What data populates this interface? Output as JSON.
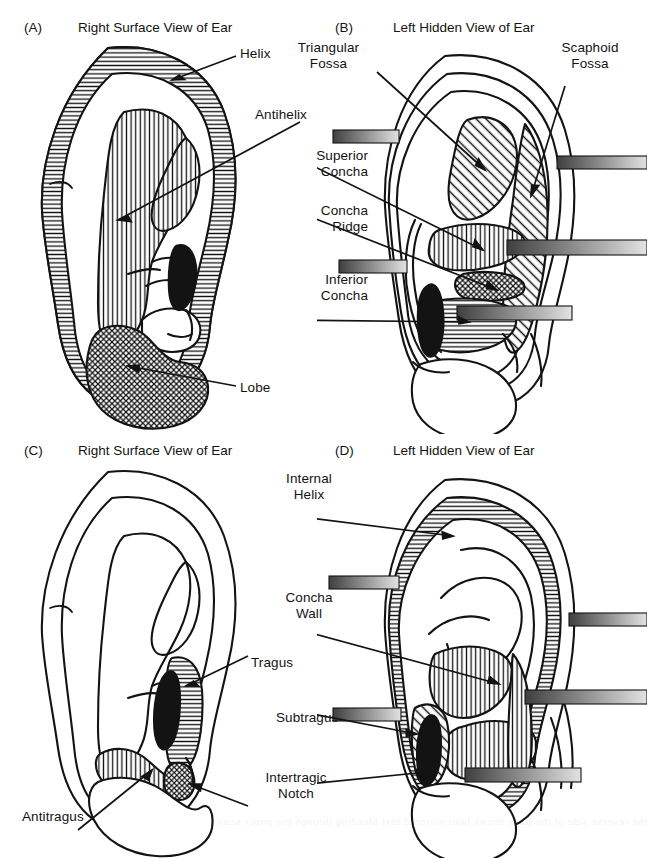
{
  "figure": {
    "background_color": "#ffffff",
    "ink_color": "#131313",
    "panel_count": 4
  },
  "panels": [
    {
      "tag": "(A)",
      "title": "Right Surface View of Ear",
      "view": "right-surface",
      "labels": [
        {
          "id": "helix",
          "text": "Helix",
          "align": "left"
        },
        {
          "id": "antihelix",
          "text": "Antihelix",
          "align": "left"
        },
        {
          "id": "lobe",
          "text": "Lobe",
          "align": "left"
        }
      ],
      "regions": [
        {
          "id": "helix",
          "fill": "horizontal-hatch"
        },
        {
          "id": "antihelix",
          "fill": "vertical-hatch"
        },
        {
          "id": "lobe",
          "fill": "cross-hatch"
        },
        {
          "id": "tragus",
          "fill": "solid-black"
        }
      ]
    },
    {
      "tag": "(B)",
      "title": "Left Hidden View of Ear",
      "view": "left-hidden",
      "labels": [
        {
          "id": "triangular-fossa",
          "text": "Triangular\nFossa",
          "align": "center"
        },
        {
          "id": "scaphoid-fossa",
          "text": "Scaphoid\nFossa",
          "align": "center"
        },
        {
          "id": "superior-concha",
          "text": "Superior\nConcha",
          "align": "right"
        },
        {
          "id": "concha-ridge",
          "text": "Concha\nRidge",
          "align": "right"
        },
        {
          "id": "inferior-concha",
          "text": "Inferior\nConcha",
          "align": "right"
        }
      ],
      "regions": [
        {
          "id": "triangular-fossa",
          "fill": "diagonal-hatch"
        },
        {
          "id": "scaphoid-fossa",
          "fill": "diagonal-hatch"
        },
        {
          "id": "superior-concha",
          "fill": "vertical-hatch"
        },
        {
          "id": "concha-ridge",
          "fill": "cross-hatch"
        },
        {
          "id": "inferior-concha",
          "fill": "horizontal-hatch"
        },
        {
          "id": "tragus",
          "fill": "solid-black"
        }
      ],
      "gradient_bars": 5
    },
    {
      "tag": "(C)",
      "title": "Right Surface View of Ear",
      "view": "right-surface",
      "labels": [
        {
          "id": "tragus",
          "text": "Tragus",
          "align": "left"
        },
        {
          "id": "subtragus",
          "text": "Subtragus",
          "align": "left"
        },
        {
          "id": "intertragic-notch",
          "text": "Intertragic\nNotch",
          "align": "center"
        },
        {
          "id": "antitragus",
          "text": "Antitragus",
          "align": "left"
        }
      ],
      "regions": [
        {
          "id": "tragus",
          "fill": "horizontal-hatch"
        },
        {
          "id": "antitragus",
          "fill": "vertical-hatch"
        },
        {
          "id": "intertragic-notch",
          "fill": "cross-hatch"
        },
        {
          "id": "subtragus",
          "fill": "solid-black"
        }
      ]
    },
    {
      "tag": "(D)",
      "title": "Left Hidden View of Ear",
      "view": "left-hidden",
      "labels": [
        {
          "id": "internal-helix",
          "text": "Internal\nHelix",
          "align": "center"
        },
        {
          "id": "concha-wall",
          "text": "Concha\nWall",
          "align": "center"
        }
      ],
      "regions": [
        {
          "id": "internal-helix",
          "fill": "horizontal-hatch"
        },
        {
          "id": "concha-wall",
          "fill": "vertical-hatch"
        },
        {
          "id": "subtragus",
          "fill": "diagonal-hatch"
        },
        {
          "id": "subtragus-core",
          "fill": "solid-black"
        }
      ],
      "gradient_bars": 5
    }
  ],
  "legend_terms": [
    "Helix",
    "Antihelix",
    "Lobe",
    "Triangular Fossa",
    "Scaphoid Fossa",
    "Superior Concha",
    "Concha Ridge",
    "Inferior Concha",
    "Tragus",
    "Subtragus",
    "Intertragic Notch",
    "Antitragus",
    "Internal Helix",
    "Concha Wall"
  ],
  "colors": {
    "ink": "#131313",
    "paper": "#ffffff",
    "bar_dark": "#4a4a4a",
    "bar_light": "#dcdcdc"
  },
  "bleed_text": "the reverse side of the page shows faint mirrored text bleeding through the paper scan"
}
